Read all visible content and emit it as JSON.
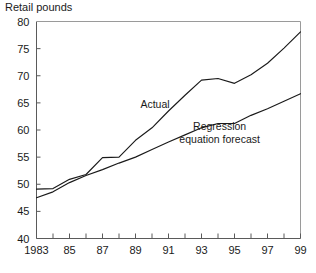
{
  "chart_data": {
    "type": "line",
    "title": "Retail pounds",
    "xlabel": "",
    "ylabel": "Retail pounds",
    "ylim": [
      40,
      80
    ],
    "xlim": [
      1983,
      1999
    ],
    "yticks": [
      40,
      45,
      50,
      55,
      60,
      65,
      70,
      75,
      80
    ],
    "ytick_labels": [
      "40",
      "45",
      "50",
      "55",
      "60",
      "65",
      "70",
      "75",
      "80"
    ],
    "xticks": [
      1983,
      1984,
      1985,
      1986,
      1987,
      1988,
      1989,
      1990,
      1991,
      1992,
      1993,
      1994,
      1995,
      1996,
      1997,
      1998,
      1999
    ],
    "xtick_labels": [
      "1983",
      "",
      "85",
      "",
      "87",
      "",
      "89",
      "",
      "91",
      "",
      "93",
      "",
      "95",
      "",
      "97",
      "",
      "99"
    ],
    "grid": false,
    "legend_position": "inline-annotations",
    "x": [
      1983,
      1984,
      1985,
      1986,
      1987,
      1988,
      1989,
      1990,
      1991,
      1992,
      1993,
      1994,
      1995,
      1996,
      1997,
      1998,
      1999
    ],
    "series": [
      {
        "name": "Actual",
        "label": "Actual",
        "color": "#1a1a1a",
        "values": [
          49.1,
          49.2,
          50.9,
          51.8,
          54.9,
          55.0,
          58.1,
          60.4,
          63.5,
          66.4,
          69.2,
          69.5,
          68.6,
          70.2,
          72.3,
          75.1,
          78.1
        ]
      },
      {
        "name": "Regression equation forecast",
        "label": "Regression\nequation forecast",
        "label_line1": "Regression",
        "label_line2": "equation forecast",
        "color": "#1a1a1a",
        "values": [
          47.5,
          48.6,
          50.3,
          51.6,
          52.7,
          53.9,
          55.0,
          56.4,
          57.8,
          59.1,
          60.4,
          61.2,
          61.2,
          62.7,
          63.9,
          65.3,
          66.7
        ]
      }
    ],
    "annotations": [
      {
        "text": "Actual",
        "x": 1989.3,
        "y": 64.1
      },
      {
        "text": "Regression",
        "x": 1994.1,
        "y": 60.0
      },
      {
        "text": "equation forecast",
        "x": 1994.1,
        "y": 57.6
      }
    ]
  },
  "colors": {
    "line": "#1a1a1a",
    "axis": "#5a5a5a",
    "frame": "#9a9a9a",
    "background": "#ffffff"
  }
}
